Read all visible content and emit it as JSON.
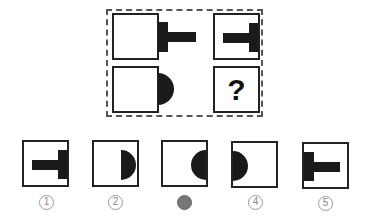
{
  "puzzle": {
    "question_mark": "?",
    "grid": [
      {
        "position": "top-left",
        "shape": "t-bar-right-outside"
      },
      {
        "position": "top-right",
        "shape": "t-bar-right-inside"
      },
      {
        "position": "bottom-left",
        "shape": "half-circle-right-outside"
      },
      {
        "position": "bottom-right",
        "shape": "unknown"
      }
    ]
  },
  "options": [
    {
      "label": "1",
      "shape": "t-bar-right-inside",
      "selected": false
    },
    {
      "label": "2",
      "shape": "half-circle-right-inside",
      "selected": false
    },
    {
      "label": "3",
      "shape": "full-semicircle-right-inside",
      "selected": true
    },
    {
      "label": "4",
      "shape": "half-circle-left-inside",
      "selected": false
    },
    {
      "label": "5",
      "shape": "t-bar-left-inside",
      "selected": false
    }
  ],
  "colors": {
    "shape": "#1a1a1a",
    "border": "#222222",
    "selected_label": "#777777"
  }
}
